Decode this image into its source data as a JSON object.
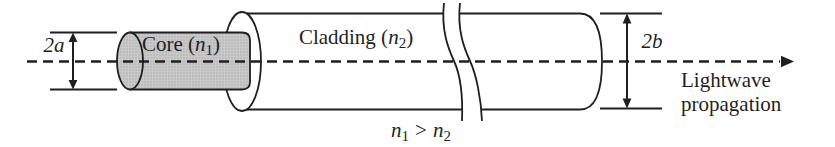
{
  "colors": {
    "ink": "#1f1f1f",
    "core_fill": "#c9c9c9",
    "background": "#ffffff"
  },
  "labels": {
    "dim_core_diameter": "2a",
    "dim_cladding_diameter": "2b",
    "core": {
      "prefix": "Core (",
      "variable": "n",
      "subscript": "1",
      "suffix": ")"
    },
    "cladding": {
      "prefix": "Cladding (",
      "variable": "n",
      "subscript": "2",
      "suffix": ")"
    },
    "inequality": {
      "lhs": "n",
      "lhs_sub": "1",
      "op": ">",
      "rhs": "n",
      "rhs_sub": "2"
    },
    "propagation_caption": {
      "line1": "Lightwave",
      "line2": "propagation"
    }
  }
}
